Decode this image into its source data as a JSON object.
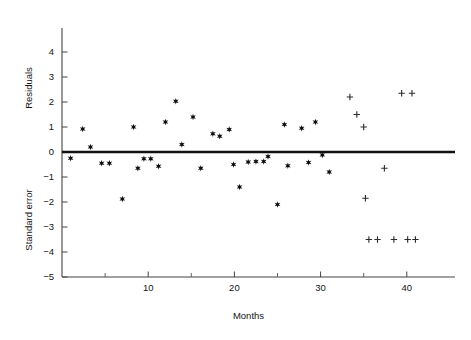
{
  "chart_data": {
    "type": "scatter",
    "title": "",
    "xlabel": "Months",
    "ylabel_upper": "Residuals",
    "ylabel_lower": "Standard error",
    "xlim": [
      0,
      45
    ],
    "ylim": [
      -5,
      4.7
    ],
    "grid": false,
    "legend": "none",
    "x_ticks_major": [
      10,
      20,
      30,
      40
    ],
    "x_ticks_minor": [
      5,
      15,
      25,
      35
    ],
    "x_tick_labels": [
      "10",
      "20",
      "30",
      "40"
    ],
    "y_ticks": [
      4,
      3,
      2,
      1,
      0,
      -1,
      -2,
      -3,
      -4,
      -5
    ],
    "y_tick_labels": [
      "4",
      "3",
      "2",
      "1",
      "0",
      "−1",
      "−2",
      "−3",
      "−4",
      "−5"
    ],
    "reference_line": {
      "y": 0,
      "label": "zero-residual-line"
    },
    "series": [
      {
        "name": "residuals-star",
        "marker": "star",
        "color": "#0d0d0d",
        "points": [
          [
            1.0,
            -0.25
          ],
          [
            2.4,
            0.92
          ],
          [
            3.3,
            0.2
          ],
          [
            4.6,
            -0.45
          ],
          [
            5.5,
            -0.45
          ],
          [
            7.0,
            -1.88
          ],
          [
            8.8,
            -0.65
          ],
          [
            9.5,
            -0.27
          ],
          [
            10.3,
            -0.27
          ],
          [
            8.3,
            1.0
          ],
          [
            11.2,
            -0.57
          ],
          [
            12.0,
            1.2
          ],
          [
            13.2,
            2.03
          ],
          [
            13.9,
            0.3
          ],
          [
            15.2,
            1.4
          ],
          [
            16.1,
            -0.65
          ],
          [
            17.5,
            0.73
          ],
          [
            18.3,
            0.63
          ],
          [
            19.4,
            0.9
          ],
          [
            19.9,
            -0.5
          ],
          [
            20.6,
            -1.4
          ],
          [
            21.6,
            -0.4
          ],
          [
            22.5,
            -0.38
          ],
          [
            23.4,
            -0.38
          ],
          [
            23.9,
            -0.18
          ],
          [
            25.0,
            -2.1
          ],
          [
            25.8,
            1.1
          ],
          [
            26.2,
            -0.55
          ],
          [
            27.8,
            0.95
          ],
          [
            28.6,
            -0.42
          ],
          [
            29.4,
            1.2
          ],
          [
            30.2,
            -0.12
          ],
          [
            31.0,
            -0.8
          ]
        ]
      },
      {
        "name": "standard-error-cross",
        "marker": "cross",
        "color": "#2a2a2a",
        "points": [
          [
            33.4,
            2.2
          ],
          [
            34.2,
            1.5
          ],
          [
            35.0,
            1.0
          ],
          [
            35.2,
            -1.85
          ],
          [
            37.4,
            -0.65
          ],
          [
            39.4,
            2.35
          ],
          [
            40.6,
            2.35
          ],
          [
            35.6,
            -3.5
          ],
          [
            36.6,
            -3.5
          ],
          [
            38.5,
            -3.5
          ],
          [
            40.1,
            -3.5
          ],
          [
            41.0,
            -3.5
          ]
        ]
      }
    ]
  },
  "axes": {
    "x_title": "Months",
    "y_title_upper": "Residuals",
    "y_title_lower": "Standard error"
  }
}
